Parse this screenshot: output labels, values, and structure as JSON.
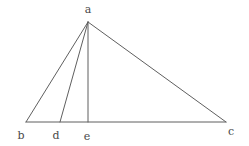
{
  "figure": {
    "name": "triangle-with-cevians",
    "canvas": {
      "width": 249,
      "height": 146
    },
    "background_color": "#ffffff",
    "stroke_color": "#5f5f5f",
    "stroke_width": 1,
    "label_color": "#4a4a4a",
    "label_font_size": 11,
    "points": {
      "a": {
        "x": 88,
        "y": 22,
        "label": "a",
        "label_x": 88,
        "label_y": 9
      },
      "b": {
        "x": 26,
        "y": 122,
        "label": "b",
        "label_x": 21,
        "label_y": 135
      },
      "c": {
        "x": 226,
        "y": 122,
        "label": "c",
        "label_x": 231,
        "label_y": 131
      },
      "d": {
        "x": 60,
        "y": 122,
        "label": "d",
        "label_x": 56,
        "label_y": 135
      },
      "e": {
        "x": 88,
        "y": 122,
        "label": "e",
        "label_x": 87,
        "label_y": 136
      }
    },
    "segments": [
      {
        "name": "side-ab",
        "from": "a",
        "to": "b"
      },
      {
        "name": "side-ac",
        "from": "a",
        "to": "c"
      },
      {
        "name": "base-bc",
        "from": "b",
        "to": "c"
      },
      {
        "name": "cevian-ad",
        "from": "a",
        "to": "d"
      },
      {
        "name": "altitude-ae",
        "from": "a",
        "to": "e"
      }
    ]
  }
}
